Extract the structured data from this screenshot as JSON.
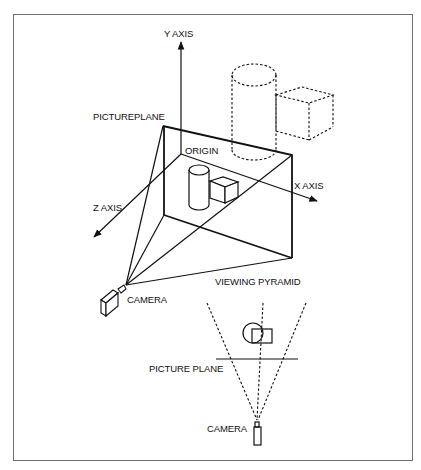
{
  "diagram": {
    "labels": {
      "y_axis": "Y AXIS",
      "x_axis": "X AXIS",
      "z_axis": "Z AXIS",
      "origin": "ORIGIN",
      "pictureplane": "PICTUREPLANE",
      "viewing_pyramid": "VIEWING PYRAMID",
      "camera_3d": "CAMERA",
      "picture_plane_top": "PICTURE PLANE",
      "camera_top": "CAMERA"
    },
    "colors": {
      "line": "#111111",
      "frame": "#6e6e6e",
      "background": "#ffffff"
    },
    "views": [
      {
        "name": "perspective-view",
        "elements": [
          "axes",
          "picture-plane",
          "viewing-pyramid",
          "cylinder",
          "cube",
          "dashed-cylinder",
          "dashed-cube",
          "camera"
        ]
      },
      {
        "name": "top-view",
        "elements": [
          "view-frustum-dashed",
          "picture-plane-line",
          "circle-object",
          "square-object",
          "camera"
        ]
      }
    ]
  }
}
